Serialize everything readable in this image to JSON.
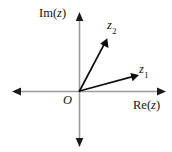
{
  "figure": {
    "background_color": "#ffffff",
    "width": 172,
    "height": 152
  },
  "axes": {
    "color": "#9a9a9a",
    "arrow_color": "#1a1a1a",
    "origin": {
      "x": 79,
      "y": 91,
      "label": "O"
    },
    "real_axis": {
      "label_prefix": "Re(",
      "label_var": "z",
      "label_suffix": ")",
      "label_full": "Re(z)",
      "from_x": 13,
      "to_x": 165,
      "y": 91,
      "arrow_left": true,
      "arrow_right": true
    },
    "imaginary_axis": {
      "label_prefix": "Im(",
      "label_var": "z",
      "label_suffix": ")",
      "label_full": "Im(z)",
      "from_y": 13,
      "to_y": 146,
      "x": 79,
      "arrow_up": true,
      "arrow_down": true
    }
  },
  "vectors": [
    {
      "name": "z1",
      "label_base": "z",
      "label_sub": "1",
      "label_full": "z₁",
      "color": "#0d0d0d",
      "tail_x": 79,
      "tail_y": 91,
      "tip_x": 138,
      "tip_y": 75
    },
    {
      "name": "z2",
      "label_base": "z",
      "label_sub": "2",
      "label_full": "z₂",
      "color": "#0d0d0d",
      "tail_x": 79,
      "tail_y": 91,
      "tip_x": 107,
      "tip_y": 38
    }
  ]
}
